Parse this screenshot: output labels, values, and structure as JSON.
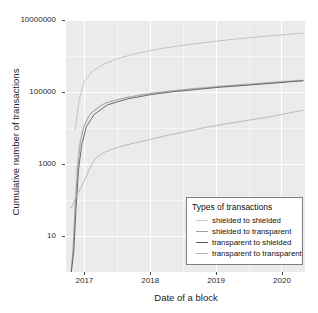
{
  "chart_data": {
    "type": "line",
    "title": "",
    "xlabel": "Date of a block",
    "ylabel": "Cumulative number of transactions",
    "yscale": "log",
    "ylim": [
      1,
      10000000
    ],
    "ytick_labels": [
      "10000000",
      "100000",
      "1000",
      "10"
    ],
    "ytick_values": [
      10000000,
      100000,
      1000,
      10
    ],
    "xtick_labels": [
      "2017",
      "2018",
      "2019",
      "2020"
    ],
    "xtick_values": [
      2017,
      2018,
      2019,
      2020
    ],
    "xlim": [
      2016.72,
      2020.35
    ],
    "grid": true,
    "legend_position": "bottom-right",
    "legend_title": "Types of transactions",
    "panel_background": "#ebebeb",
    "grid_color": "#ffffff",
    "series": [
      {
        "name": "shielded to shielded",
        "color": "#c9c9c9",
        "points": [
          [
            2016.8,
            1
          ],
          [
            2016.82,
            3
          ],
          [
            2016.85,
            40
          ],
          [
            2016.88,
            600
          ],
          [
            2016.92,
            3000
          ],
          [
            2016.97,
            9000
          ],
          [
            2017.05,
            20000
          ],
          [
            2017.2,
            38000
          ],
          [
            2017.4,
            56000
          ],
          [
            2017.7,
            74000
          ],
          [
            2018.0,
            92000
          ],
          [
            2018.35,
            110000
          ],
          [
            2018.7,
            128000
          ],
          [
            2019.0,
            145000
          ],
          [
            2019.4,
            163000
          ],
          [
            2019.8,
            185000
          ],
          [
            2020.1,
            205000
          ],
          [
            2020.32,
            215000
          ]
        ]
      },
      {
        "name": "shielded to transparent",
        "color": "#9f9f9f",
        "points": [
          [
            2016.8,
            1
          ],
          [
            2016.83,
            5
          ],
          [
            2016.86,
            70
          ],
          [
            2016.9,
            900
          ],
          [
            2016.94,
            4200
          ],
          [
            2017.0,
            12000
          ],
          [
            2017.1,
            26000
          ],
          [
            2017.3,
            48000
          ],
          [
            2017.6,
            68000
          ],
          [
            2017.95,
            88000
          ],
          [
            2018.3,
            106000
          ],
          [
            2018.7,
            124000
          ],
          [
            2019.05,
            142000
          ],
          [
            2019.45,
            160000
          ],
          [
            2019.85,
            182000
          ],
          [
            2020.15,
            200000
          ],
          [
            2020.32,
            208000
          ]
        ]
      },
      {
        "name": "transparent to shielded",
        "color": "#5a5a5a",
        "points": [
          [
            2016.8,
            1
          ],
          [
            2016.84,
            4
          ],
          [
            2016.87,
            50
          ],
          [
            2016.91,
            700
          ],
          [
            2016.96,
            3500
          ],
          [
            2017.03,
            11000
          ],
          [
            2017.15,
            24000
          ],
          [
            2017.35,
            44000
          ],
          [
            2017.65,
            64000
          ],
          [
            2018.0,
            84000
          ],
          [
            2018.35,
            102000
          ],
          [
            2018.75,
            120000
          ],
          [
            2019.1,
            138000
          ],
          [
            2019.5,
            156000
          ],
          [
            2019.9,
            178000
          ],
          [
            2020.18,
            196000
          ],
          [
            2020.32,
            204000
          ]
        ]
      },
      {
        "name": "transparent to transparent",
        "color": "#b4b4b4",
        "points": [
          [
            2016.8,
            60
          ],
          [
            2016.88,
            130
          ],
          [
            2016.95,
            230
          ],
          [
            2017.02,
            420
          ],
          [
            2017.1,
            900
          ],
          [
            2017.18,
            1500
          ],
          [
            2017.3,
            2100
          ],
          [
            2017.5,
            2900
          ],
          [
            2017.75,
            3800
          ],
          [
            2018.0,
            4800
          ],
          [
            2018.25,
            6200
          ],
          [
            2018.55,
            8000
          ],
          [
            2018.85,
            10500
          ],
          [
            2019.15,
            13000
          ],
          [
            2019.5,
            16500
          ],
          [
            2019.85,
            21000
          ],
          [
            2020.1,
            26000
          ],
          [
            2020.32,
            31000
          ]
        ]
      },
      {
        "name": "top-series-transparent-to-transparent-upper",
        "color": "#bdbdbd",
        "points": [
          [
            2016.86,
            9000
          ],
          [
            2016.92,
            60000
          ],
          [
            2017.0,
            200000
          ],
          [
            2017.12,
            380000
          ],
          [
            2017.3,
            600000
          ],
          [
            2017.55,
            900000
          ],
          [
            2017.85,
            1250000
          ],
          [
            2018.2,
            1650000
          ],
          [
            2018.55,
            2050000
          ],
          [
            2018.9,
            2450000
          ],
          [
            2019.25,
            2900000
          ],
          [
            2019.6,
            3350000
          ],
          [
            2019.95,
            3800000
          ],
          [
            2020.32,
            4300000
          ]
        ]
      }
    ],
    "legend_entries": [
      {
        "label": "shielded to shielded",
        "color": "#c9c9c9"
      },
      {
        "label": "shielded to transparent",
        "color": "#9f9f9f"
      },
      {
        "label": "transparent to shielded",
        "color": "#5a5a5a"
      },
      {
        "label": "transparent to transparent",
        "color": "#b4b4b4"
      }
    ]
  }
}
